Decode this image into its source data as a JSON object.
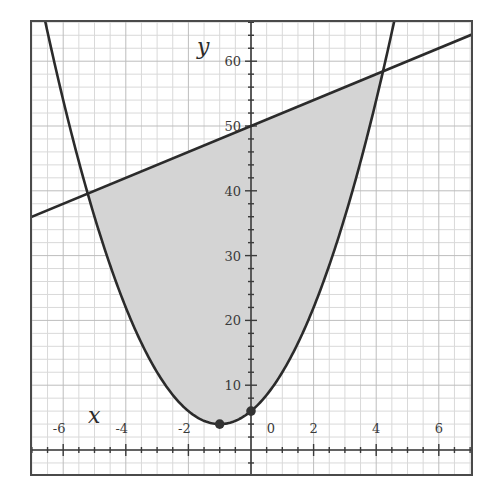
{
  "chart_data": {
    "type": "line",
    "title": "",
    "xlabel": "x",
    "ylabel": "y",
    "xlim": [
      -6.95,
      7.1
    ],
    "ylim": [
      -4,
      66
    ],
    "grid": true,
    "x_ticks": [
      -6,
      -4,
      -2,
      0,
      2,
      4,
      6
    ],
    "x_tick_labels": [
      "-6",
      "-4",
      "-2",
      "0",
      "2",
      "4",
      "6"
    ],
    "y_ticks": [
      10,
      20,
      30,
      40,
      50,
      60
    ],
    "y_tick_labels": [
      "10",
      "20",
      "30",
      "40",
      "50",
      "60"
    ],
    "series": [
      {
        "name": "parabola",
        "kind": "curve",
        "equation": "y = 2(x+1)^2 + 4",
        "a": 2,
        "h": -1,
        "k": 4,
        "color": "#2b2b2b"
      },
      {
        "name": "line",
        "kind": "line",
        "equation": "y = 2x + 50",
        "slope": 2,
        "intercept": 50,
        "color": "#2b2b2b"
      }
    ],
    "shaded_region": {
      "description": "region between parabola (below) and line (above)",
      "x_from": -5.217,
      "x_to": 4.217,
      "fill": "#d4d4d4"
    },
    "points": [
      {
        "label": "vertex",
        "x": -1,
        "y": 4
      },
      {
        "label": "y-intercept",
        "x": 0,
        "y": 6
      }
    ],
    "intersections": [
      {
        "x": -5.217,
        "y": 39.57
      },
      {
        "x": 4.217,
        "y": 58.43
      }
    ]
  },
  "colors": {
    "frame": "#4a4a4a",
    "grid_minor": "#d9d9d9",
    "grid_major": "#bdbdbd",
    "axis": "#3a3a3a",
    "curve": "#2b2b2b",
    "shade": "#d4d4d4",
    "point": "#333333"
  }
}
